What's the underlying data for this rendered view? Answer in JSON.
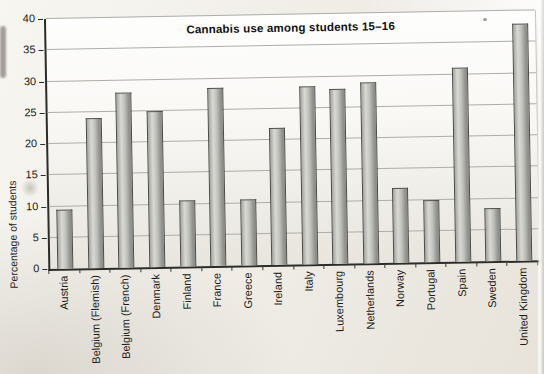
{
  "chart_data": {
    "type": "bar",
    "title": "Cannabis use among students 15–16",
    "ylabel": "Percentage of students",
    "xlabel": "",
    "ylim": [
      0,
      40
    ],
    "y_tick_step": 5,
    "y_ticks": [
      0,
      5,
      10,
      15,
      20,
      25,
      30,
      35,
      40
    ],
    "grid": true,
    "legend": "none",
    "values_unit": "percent",
    "categories": [
      "Austria",
      "Belgium (Flemish)",
      "Belgium (French)",
      "Denmark",
      "Finland",
      "France",
      "Greece",
      "Ireland",
      "Italy",
      "Luxembourg",
      "Netherlands",
      "Norway",
      "Portugal",
      "Spain",
      "Sweden",
      "United Kingdom"
    ],
    "values": [
      9.5,
      24,
      28,
      25,
      10.5,
      28.5,
      10.5,
      22,
      28.5,
      28,
      29,
      12,
      10,
      31,
      8.5,
      38
    ],
    "colors": {
      "bar_fill_light": "#d9d9d4",
      "bar_fill_dark": "#8a8a86",
      "bar_border": "#4c4c49",
      "gridline": "#aeada9",
      "axis": "#2c2c2a",
      "text": "#111111",
      "paper": "#efece6"
    }
  }
}
